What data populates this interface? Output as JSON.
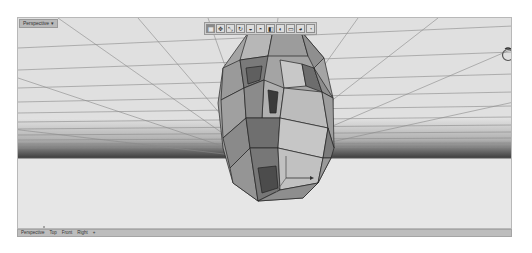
{
  "viewport": {
    "label": "Perspective ▾",
    "background": "#e2e2e2",
    "grid_color": "#7d7d7d",
    "horizon_dark": "#4a4a4a",
    "ground_color": "#e6e6e6"
  },
  "toolbar": {
    "tools": [
      {
        "name": "wireframe-tool",
        "glyph": "▦",
        "active": true
      },
      {
        "name": "move-tool",
        "glyph": "✥"
      },
      {
        "name": "transform-tool",
        "glyph": "⤡"
      },
      {
        "name": "rotate-tool",
        "glyph": "↻"
      },
      {
        "name": "shaded-tool",
        "glyph": "◒"
      },
      {
        "name": "rendered-tool",
        "glyph": "◓"
      },
      {
        "name": "ghosted-tool",
        "glyph": "◧"
      },
      {
        "name": "xray-tool",
        "glyph": "◐"
      },
      {
        "name": "technical-tool",
        "glyph": "▭"
      },
      {
        "name": "artistic-tool",
        "glyph": "◕"
      },
      {
        "name": "pen-tool",
        "glyph": "◔"
      }
    ]
  },
  "tabs": [
    "Perspective",
    "Top",
    "Front",
    "Right",
    "+"
  ]
}
